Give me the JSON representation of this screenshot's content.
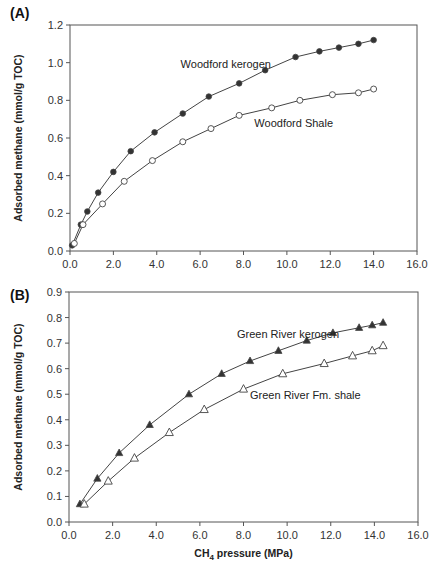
{
  "colors": {
    "axis": "#555555",
    "line": "#444444",
    "marker_fill_filled": "#333333",
    "marker_fill_open": "#ffffff",
    "text": "#222222"
  },
  "chart_data": [
    {
      "panel": "(A)",
      "type": "line",
      "title": "",
      "xlabel": "",
      "ylabel": "Adsorbed methane (mmol/g TOC)",
      "xlim": [
        0,
        16
      ],
      "ylim": [
        0,
        1.2
      ],
      "xticks": [
        "0.0",
        "2.0",
        "4.0",
        "6.0",
        "8.0",
        "10.0",
        "12.0",
        "14.0",
        "16.0"
      ],
      "yticks": [
        "0.0",
        "0.2",
        "0.4",
        "0.6",
        "0.8",
        "1.0",
        "1.2"
      ],
      "grid": false,
      "legend": "inline labels",
      "series": [
        {
          "name": "Woodford kerogen",
          "marker": "filled-circle",
          "x": [
            0.1,
            0.5,
            0.8,
            1.3,
            2.0,
            2.8,
            3.9,
            5.2,
            6.4,
            7.8,
            9.0,
            10.4,
            11.5,
            12.4,
            13.3,
            14.0
          ],
          "y": [
            0.03,
            0.14,
            0.21,
            0.31,
            0.42,
            0.53,
            0.63,
            0.73,
            0.82,
            0.89,
            0.96,
            1.03,
            1.06,
            1.08,
            1.1,
            1.12
          ],
          "label_pos": [
            5.1,
            0.97
          ]
        },
        {
          "name": "Woodford Shale",
          "marker": "open-circle",
          "x": [
            0.2,
            0.6,
            1.5,
            2.5,
            3.8,
            5.2,
            6.5,
            7.8,
            9.3,
            10.6,
            12.1,
            13.3,
            14.0
          ],
          "y": [
            0.04,
            0.14,
            0.25,
            0.37,
            0.48,
            0.58,
            0.65,
            0.72,
            0.76,
            0.8,
            0.83,
            0.84,
            0.86
          ],
          "label_pos": [
            8.5,
            0.66
          ]
        }
      ]
    },
    {
      "panel": "(B)",
      "type": "line",
      "title": "",
      "xlabel": "CH4 pressure (MPa)",
      "ylabel": "Adsorbed methane (mmol/g TOC)",
      "xlim": [
        0,
        16
      ],
      "ylim": [
        0,
        0.9
      ],
      "xticks": [
        "0.0",
        "2.0",
        "4.0",
        "6.0",
        "8.0",
        "10.0",
        "12.0",
        "14.0",
        "16.0"
      ],
      "yticks": [
        "0.0",
        "0.1",
        "0.2",
        "0.3",
        "0.4",
        "0.5",
        "0.6",
        "0.7",
        "0.8",
        "0.9"
      ],
      "grid": false,
      "legend": "inline labels",
      "series": [
        {
          "name": "Green River kerogen",
          "marker": "filled-triangle",
          "x": [
            0.5,
            1.3,
            2.3,
            3.7,
            5.5,
            7.0,
            8.3,
            9.6,
            10.9,
            12.1,
            13.3,
            13.9,
            14.4
          ],
          "y": [
            0.07,
            0.17,
            0.27,
            0.38,
            0.5,
            0.58,
            0.63,
            0.67,
            0.71,
            0.74,
            0.76,
            0.77,
            0.78
          ],
          "label_pos": [
            7.7,
            0.72
          ]
        },
        {
          "name": "Green River Fm. shale",
          "marker": "open-triangle",
          "x": [
            0.7,
            1.8,
            3.0,
            4.6,
            6.2,
            8.0,
            9.8,
            11.7,
            13.0,
            13.9,
            14.4
          ],
          "y": [
            0.07,
            0.16,
            0.25,
            0.35,
            0.44,
            0.52,
            0.58,
            0.62,
            0.65,
            0.67,
            0.69
          ],
          "label_pos": [
            8.3,
            0.48
          ]
        }
      ]
    }
  ],
  "labels": {
    "panel_a": "(A)",
    "panel_b": "(B)",
    "ylabel": "Adsorbed methane (mmol/g TOC)",
    "xlabel_prefix": "CH",
    "xlabel_sub": "4",
    "xlabel_suffix": " pressure (MPa)"
  }
}
